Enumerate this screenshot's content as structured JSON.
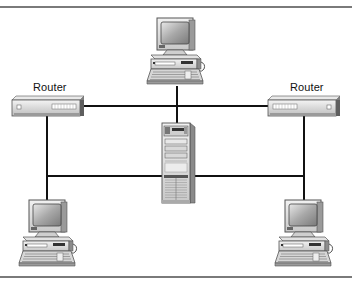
{
  "diagram": {
    "type": "network-topology",
    "nodes": [
      {
        "id": "pc-top",
        "kind": "workstation",
        "label": ""
      },
      {
        "id": "router-left",
        "kind": "router",
        "label": "Router"
      },
      {
        "id": "router-right",
        "kind": "router",
        "label": "Router"
      },
      {
        "id": "server",
        "kind": "server-tower",
        "label": ""
      },
      {
        "id": "pc-bottom-left",
        "kind": "workstation",
        "label": ""
      },
      {
        "id": "pc-bottom-right",
        "kind": "workstation",
        "label": ""
      }
    ],
    "edges": [
      {
        "from": "pc-top",
        "to": "server"
      },
      {
        "from": "router-left",
        "to": "router-right"
      },
      {
        "from": "router-left",
        "to": "pc-bottom-left"
      },
      {
        "from": "router-right",
        "to": "pc-bottom-right"
      },
      {
        "from": "pc-bottom-left-line",
        "to": "server"
      },
      {
        "from": "server",
        "to": "pc-bottom-right-line"
      }
    ],
    "labels": {
      "router_left": "Router",
      "router_right": "Router"
    },
    "colors": {
      "line": "#111111",
      "frame": "#7a7a7a",
      "device_body": "#d9d9d9",
      "device_shadow": "#8c8c8c",
      "screen": "#9a9a9a"
    }
  }
}
